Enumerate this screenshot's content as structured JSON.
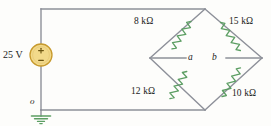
{
  "figure": {
    "type": "electrical-circuit-schematic",
    "colors": {
      "wire": "#8d9099",
      "resistor": "#5c9e63",
      "source_fill": "#f2d98a",
      "source_stroke": "#c79a2e",
      "ground": "#5c9e63",
      "text": "#1a1a1a",
      "background": "#fdfdfb"
    }
  },
  "source": {
    "label": "25 V",
    "plus_sign": "+",
    "minus_sign": "−",
    "symbol_name": "voltage-source-circle"
  },
  "resistors": [
    {
      "id": "r-8k",
      "label": "8 kΩ",
      "value": 8,
      "unit": "kΩ",
      "position": "top-left-branch"
    },
    {
      "id": "r-15k",
      "label": "15 kΩ",
      "value": 15,
      "unit": "kΩ",
      "position": "top-right-branch"
    },
    {
      "id": "r-12k",
      "label": "12 kΩ",
      "value": 12,
      "unit": "kΩ",
      "position": "bottom-left-branch"
    },
    {
      "id": "r-10k",
      "label": "10 kΩ",
      "value": 10,
      "unit": "kΩ",
      "position": "bottom-right-branch"
    }
  ],
  "nodes": [
    {
      "id": "node-a",
      "label": "a",
      "position": "bridge-left-terminal"
    },
    {
      "id": "node-b",
      "label": "b",
      "position": "bridge-right-terminal"
    },
    {
      "id": "node-o",
      "label": "o",
      "position": "ground-reference"
    }
  ],
  "ground": {
    "symbol_name": "earth-ground-symbol"
  }
}
